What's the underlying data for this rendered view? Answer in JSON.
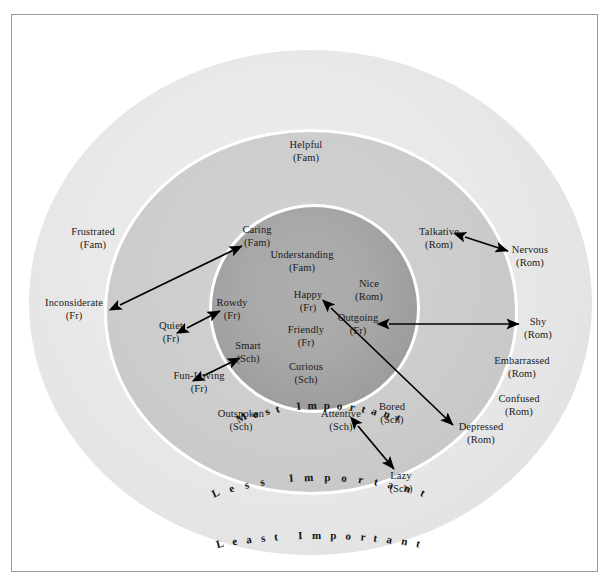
{
  "figure": {
    "zones": [
      {
        "id": "inner",
        "label": "Most Important",
        "fill": "#a4a4a4"
      },
      {
        "id": "middle",
        "label": "Less Important",
        "fill": "#c9c9c9"
      },
      {
        "id": "outer",
        "label": "Least Important",
        "fill": "#e7e7e7"
      }
    ],
    "nodes": [
      {
        "id": "helpful",
        "name": "Helpful",
        "cat": "(Fam)",
        "zone": "middle",
        "x": 305,
        "y": 150
      },
      {
        "id": "caring",
        "name": "Caring",
        "cat": "(Fam)",
        "zone": "inner",
        "x": 256,
        "y": 235
      },
      {
        "id": "understanding",
        "name": "Understanding",
        "cat": "(Fam)",
        "zone": "inner",
        "x": 301,
        "y": 260
      },
      {
        "id": "nice",
        "name": "Nice",
        "cat": "(Rom)",
        "zone": "inner",
        "x": 368,
        "y": 289
      },
      {
        "id": "happy",
        "name": "Happy",
        "cat": "(Fr)",
        "zone": "inner",
        "x": 307,
        "y": 300
      },
      {
        "id": "rowdy",
        "name": "Rowdy",
        "cat": "(Fr)",
        "zone": "inner",
        "x": 231,
        "y": 308
      },
      {
        "id": "outgoing",
        "name": "Outgoing",
        "cat": "(Fr)",
        "zone": "inner",
        "x": 357,
        "y": 323
      },
      {
        "id": "friendly",
        "name": "Friendly",
        "cat": "(Fr)",
        "zone": "inner",
        "x": 305,
        "y": 335
      },
      {
        "id": "smart",
        "name": "Smart",
        "cat": "(Sch)",
        "zone": "inner",
        "x": 247,
        "y": 351
      },
      {
        "id": "curious",
        "name": "Curious",
        "cat": "(Sch)",
        "zone": "inner",
        "x": 305,
        "y": 372
      },
      {
        "id": "talkative",
        "name": "Talkative",
        "cat": "(Rom)",
        "zone": "middle",
        "x": 438,
        "y": 237
      },
      {
        "id": "quiet",
        "name": "Quiet",
        "cat": "(Fr)",
        "zone": "middle",
        "x": 170,
        "y": 331
      },
      {
        "id": "funloving",
        "name": "Fun-Loving",
        "cat": "(Fr)",
        "zone": "middle",
        "x": 198,
        "y": 381
      },
      {
        "id": "outspoken",
        "name": "Outspoken",
        "cat": "(Sch)",
        "zone": "middle",
        "x": 240,
        "y": 419
      },
      {
        "id": "attentive",
        "name": "Attentive",
        "cat": "(Sch)",
        "zone": "middle",
        "x": 340,
        "y": 419
      },
      {
        "id": "bored",
        "name": "Bored",
        "cat": "(Sch)",
        "zone": "middle",
        "x": 391,
        "y": 412
      },
      {
        "id": "frustrated",
        "name": "Frustrated",
        "cat": "(Fam)",
        "zone": "outer",
        "x": 92,
        "y": 237
      },
      {
        "id": "inconsiderate",
        "name": "Inconsiderate",
        "cat": "(Fr)",
        "zone": "outer",
        "x": 73,
        "y": 308
      },
      {
        "id": "nervous",
        "name": "Nervous",
        "cat": "(Rom)",
        "zone": "outer",
        "x": 529,
        "y": 255
      },
      {
        "id": "shy",
        "name": "Shy",
        "cat": "(Rom)",
        "zone": "outer",
        "x": 537,
        "y": 327
      },
      {
        "id": "embarrassed",
        "name": "Embarrassed",
        "cat": "(Rom)",
        "zone": "outer",
        "x": 521,
        "y": 366
      },
      {
        "id": "confused",
        "name": "Confused",
        "cat": "(Rom)",
        "zone": "outer",
        "x": 518,
        "y": 404
      },
      {
        "id": "depressed",
        "name": "Depressed",
        "cat": "(Rom)",
        "zone": "outer",
        "x": 480,
        "y": 432
      },
      {
        "id": "lazy",
        "name": "Lazy",
        "cat": "(Sch)",
        "zone": "outer",
        "x": 400,
        "y": 481
      }
    ],
    "arrows": [
      {
        "id": "inconsiderate-caring",
        "from": "Inconsiderate (Fr)",
        "to": "Caring (Fam)",
        "x1": 119,
        "y1": 304,
        "x2": 241,
        "y2": 245
      },
      {
        "id": "quiet-rowdy",
        "from": "Quiet (Fr)",
        "to": "Rowdy (Fr)",
        "x1": 186,
        "y1": 327,
        "x2": 219,
        "y2": 310
      },
      {
        "id": "funloving-smart",
        "from": "Fun-Loving (Fr)",
        "to": "Smart (Sch)",
        "x1": 202,
        "y1": 375,
        "x2": 239,
        "y2": 357
      },
      {
        "id": "talkative-nervous",
        "from": "Talkative (Rom)",
        "to": "Nervous (Rom)",
        "x1": 464,
        "y1": 236,
        "x2": 507,
        "y2": 250
      },
      {
        "id": "outgoing-shy",
        "from": "Outgoing (Fr)",
        "to": "Shy (Rom)",
        "x1": 388,
        "y1": 323,
        "x2": 518,
        "y2": 323
      },
      {
        "id": "happy-depressed",
        "from": "Happy (Fr)",
        "to": "Depressed (Rom)",
        "x1": 330,
        "y1": 307,
        "x2": 452,
        "y2": 424
      },
      {
        "id": "attentive-lazy",
        "from": "Attentive (Sch)",
        "to": "Lazy (Sch)",
        "x1": 357,
        "y1": 425,
        "x2": 393,
        "y2": 468
      }
    ],
    "legend_codes": {
      "Fam": "Family",
      "Fr": "Friend",
      "Rom": "Romantic",
      "Sch": "School"
    }
  }
}
